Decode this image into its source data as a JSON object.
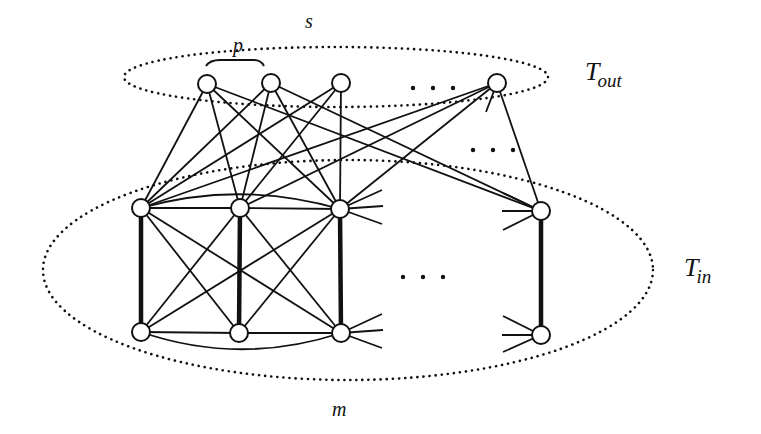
{
  "labels": {
    "p": {
      "text": "p",
      "x": 233,
      "y": 52,
      "size": 20
    },
    "s": {
      "text": "s",
      "x": 305,
      "y": 28,
      "size": 20
    },
    "m": {
      "text": "m",
      "x": 332,
      "y": 416,
      "size": 20
    },
    "t_out": {
      "main": "T",
      "sub": "out",
      "x": 585,
      "y": 80,
      "size": 26,
      "subsize": 19
    },
    "t_in": {
      "main": "T",
      "sub": "in",
      "x": 684,
      "y": 276,
      "size": 26,
      "subsize": 19
    }
  },
  "ellipses": [
    {
      "name": "t-out-ellipse",
      "cx": 336,
      "cy": 77,
      "rx": 212,
      "ry": 30
    },
    {
      "name": "t-in-ellipse",
      "cx": 348,
      "cy": 270,
      "rx": 305,
      "ry": 110
    }
  ],
  "brace": {
    "x1": 206,
    "x2": 264,
    "y": 60
  },
  "ellipsis_dots": [
    {
      "name": "top-row-ellipsis",
      "x": 413,
      "y": 88,
      "gap": 20
    },
    {
      "name": "middle-ellipsis",
      "x": 473,
      "y": 150,
      "gap": 20
    },
    {
      "name": "inner-ellipsis",
      "x": 403,
      "y": 277,
      "gap": 20
    }
  ],
  "nodes": {
    "top": [
      [
        207,
        84
      ],
      [
        271,
        83
      ],
      [
        341,
        83
      ],
      [
        497,
        83
      ]
    ],
    "mid": [
      [
        141,
        208
      ],
      [
        240,
        208
      ],
      [
        340,
        209
      ],
      [
        541,
        211
      ]
    ],
    "bot": [
      [
        141,
        332
      ],
      [
        239,
        333
      ],
      [
        341,
        333
      ],
      [
        541,
        335
      ]
    ]
  },
  "node_radius": 9,
  "thick_edges": [
    [
      [
        141,
        208
      ],
      [
        141,
        332
      ]
    ],
    [
      [
        240,
        208
      ],
      [
        239,
        333
      ]
    ],
    [
      [
        340,
        209
      ],
      [
        341,
        333
      ]
    ],
    [
      [
        541,
        211
      ],
      [
        541,
        335
      ]
    ]
  ],
  "edges": [
    [
      [
        207,
        84
      ],
      [
        141,
        208
      ]
    ],
    [
      [
        207,
        84
      ],
      [
        240,
        208
      ]
    ],
    [
      [
        207,
        84
      ],
      [
        340,
        209
      ]
    ],
    [
      [
        207,
        84
      ],
      [
        541,
        211
      ]
    ],
    [
      [
        271,
        83
      ],
      [
        141,
        208
      ]
    ],
    [
      [
        271,
        83
      ],
      [
        240,
        208
      ]
    ],
    [
      [
        271,
        83
      ],
      [
        340,
        209
      ]
    ],
    [
      [
        271,
        83
      ],
      [
        541,
        211
      ]
    ],
    [
      [
        341,
        83
      ],
      [
        141,
        208
      ]
    ],
    [
      [
        341,
        83
      ],
      [
        240,
        208
      ]
    ],
    [
      [
        341,
        83
      ],
      [
        340,
        209
      ]
    ],
    [
      [
        497,
        83
      ],
      [
        141,
        208
      ]
    ],
    [
      [
        497,
        83
      ],
      [
        240,
        208
      ]
    ],
    [
      [
        497,
        83
      ],
      [
        340,
        209
      ]
    ],
    [
      [
        497,
        83
      ],
      [
        541,
        211
      ]
    ],
    [
      [
        497,
        83
      ],
      [
        486,
        112
      ]
    ],
    [
      [
        141,
        208
      ],
      [
        240,
        208
      ]
    ],
    [
      [
        240,
        208
      ],
      [
        340,
        209
      ]
    ],
    [
      [
        141,
        332
      ],
      [
        239,
        333
      ]
    ],
    [
      [
        239,
        333
      ],
      [
        341,
        333
      ]
    ],
    [
      [
        141,
        208
      ],
      [
        239,
        333
      ]
    ],
    [
      [
        141,
        208
      ],
      [
        341,
        333
      ]
    ],
    [
      [
        240,
        208
      ],
      [
        141,
        332
      ]
    ],
    [
      [
        240,
        208
      ],
      [
        341,
        333
      ]
    ],
    [
      [
        340,
        209
      ],
      [
        141,
        332
      ]
    ],
    [
      [
        340,
        209
      ],
      [
        239,
        333
      ]
    ],
    [
      [
        340,
        209
      ],
      [
        382,
        190
      ]
    ],
    [
      [
        340,
        209
      ],
      [
        383,
        206
      ]
    ],
    [
      [
        340,
        209
      ],
      [
        382,
        224
      ]
    ],
    [
      [
        341,
        333
      ],
      [
        382,
        314
      ]
    ],
    [
      [
        341,
        333
      ],
      [
        383,
        330
      ]
    ],
    [
      [
        341,
        333
      ],
      [
        382,
        348
      ]
    ],
    [
      [
        541,
        211
      ],
      [
        503,
        193
      ]
    ],
    [
      [
        541,
        211
      ],
      [
        502,
        211
      ]
    ],
    [
      [
        541,
        211
      ],
      [
        503,
        230
      ]
    ],
    [
      [
        541,
        335
      ],
      [
        503,
        316
      ]
    ],
    [
      [
        541,
        335
      ],
      [
        502,
        335
      ]
    ],
    [
      [
        541,
        335
      ],
      [
        503,
        352
      ]
    ]
  ],
  "curves": [
    {
      "d": "M141,208 Q240,180 340,209"
    },
    {
      "d": "M141,332 Q240,366 341,333"
    }
  ],
  "colors": {
    "ink": "#111111",
    "background": "#ffffff"
  }
}
